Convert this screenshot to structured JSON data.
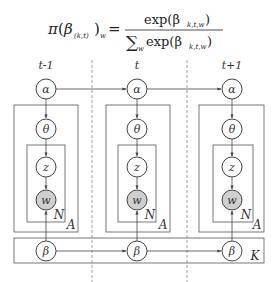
{
  "formula": {
    "lhs_pi": "π",
    "lhs_beta": "β",
    "lhs_sub": "(k,t)",
    "lhs_w": "w",
    "equals": "=",
    "numerator": "exp(β",
    "numerator_sub": "k,t,w",
    "numerator_close": ")",
    "denominator_sum": "∑",
    "denominator_sum_sub": "w",
    "denominator": "exp(β",
    "denominator_sub": "k,t,w",
    "denominator_close": ")"
  },
  "time_labels": [
    "t-1",
    "t",
    "t+1"
  ],
  "nodes": {
    "alpha": "α",
    "theta": "θ",
    "z": "z",
    "w": "w",
    "beta": "β"
  },
  "plates": {
    "inner": "N",
    "middle": "A",
    "outer": "K"
  },
  "colors": {
    "line": "#555555",
    "observed_fill": "#cfcfcf",
    "node_fill": "#ffffff",
    "dashed": "#888888"
  }
}
